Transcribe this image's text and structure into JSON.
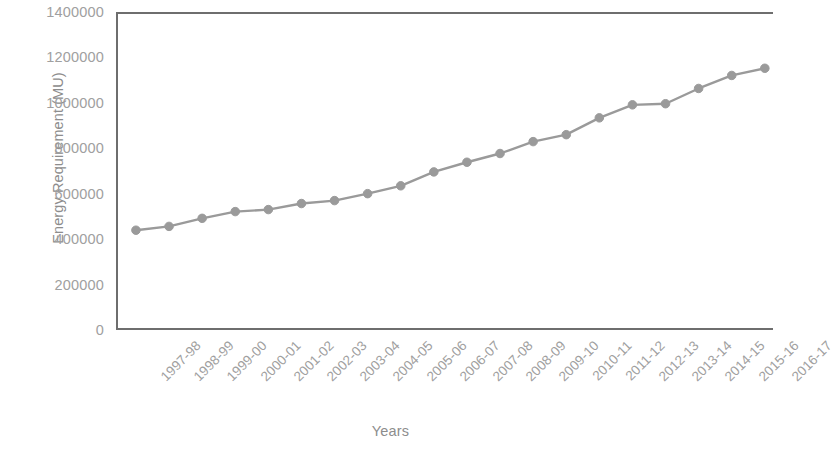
{
  "chart_data": {
    "type": "line",
    "title": "",
    "xlabel": "Years",
    "ylabel": "Energy Requirement (MU)",
    "categories": [
      "1997-98",
      "1998-99",
      "1999-00",
      "2000-01",
      "2001-02",
      "2002-03",
      "2003-04",
      "2004-05",
      "2005-06",
      "2006-07",
      "2007-08",
      "2008-09",
      "2009-10",
      "2010-11",
      "2011-12",
      "2012-13",
      "2013-14",
      "2014-15",
      "2015-16",
      "2016-17"
    ],
    "values": [
      436000,
      453000,
      489000,
      519000,
      528000,
      555000,
      568000,
      599000,
      634000,
      696000,
      739000,
      778000,
      831000,
      862000,
      937000,
      995000,
      1000000,
      1068000,
      1126000,
      1158000
    ],
    "ylim": [
      0,
      1400000
    ],
    "ytick_step": 200000,
    "ytick_labels": [
      "0",
      "200000",
      "400000",
      "600000",
      "800000",
      "1000000",
      "1200000",
      "1400000"
    ],
    "grid": false,
    "legend": "none",
    "series_color": "#9a9a9a",
    "marker": "circle",
    "marker_color": "#9a9a9a",
    "axis_color": "#6e6e6e",
    "text_color": "#9a9a9a"
  }
}
